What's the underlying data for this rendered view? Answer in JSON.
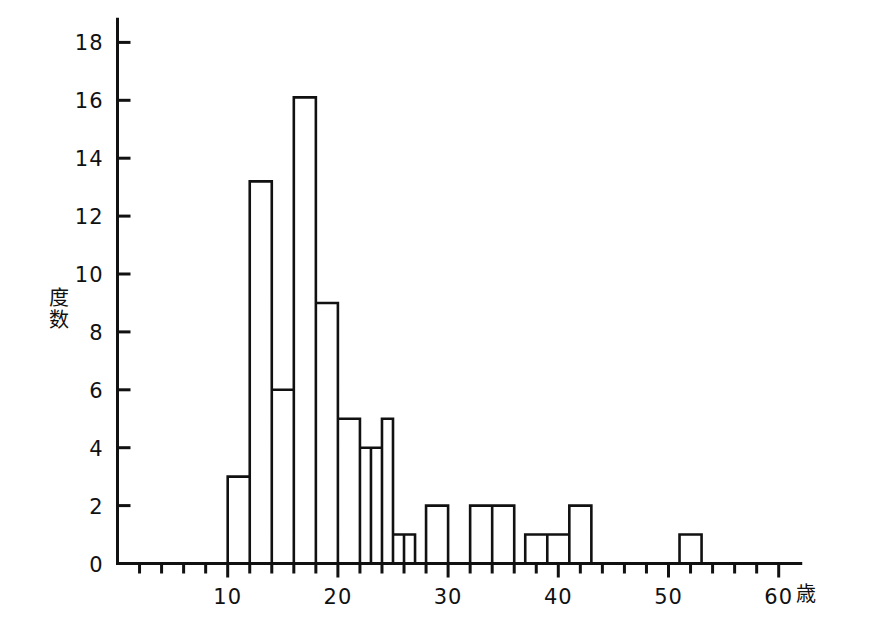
{
  "chart_data": {
    "type": "bar",
    "title": "",
    "subtitle": "",
    "xlabel": "歳",
    "ylabel": "度数",
    "xlim": [
      0,
      62
    ],
    "ylim": [
      0,
      18.8
    ],
    "bin_width": 2,
    "grid": false,
    "legend": false,
    "x_ticks": [
      0,
      2,
      4,
      6,
      8,
      10,
      12,
      14,
      16,
      18,
      20,
      22,
      24,
      26,
      28,
      30,
      32,
      34,
      36,
      38,
      40,
      42,
      44,
      46,
      48,
      50,
      52,
      54,
      56,
      58,
      60
    ],
    "x_tick_labels": [
      "10",
      "20",
      "30",
      "40",
      "50",
      "60"
    ],
    "x_labeled_ticks": [
      10,
      20,
      30,
      40,
      50,
      60
    ],
    "y_ticks": [
      0,
      2,
      4,
      6,
      8,
      10,
      12,
      14,
      16,
      18
    ],
    "y_tick_labels": [
      "0",
      "2",
      "4",
      "6",
      "8",
      "10",
      "12",
      "14",
      "16",
      "18"
    ],
    "bins": [
      {
        "start": 10,
        "end": 12,
        "value": 3
      },
      {
        "start": 12,
        "end": 14,
        "value": 13.2
      },
      {
        "start": 14,
        "end": 16,
        "value": 6
      },
      {
        "start": 16,
        "end": 18,
        "value": 16.1
      },
      {
        "start": 18,
        "end": 20,
        "value": 9
      },
      {
        "start": 20,
        "end": 22,
        "value": 5
      },
      {
        "start": 22,
        "end": 23,
        "value": 4
      },
      {
        "start": 23,
        "end": 24,
        "value": 4
      },
      {
        "start": 24,
        "end": 25,
        "value": 5
      },
      {
        "start": 25,
        "end": 26,
        "value": 1
      },
      {
        "start": 26,
        "end": 27,
        "value": 1
      },
      {
        "start": 28,
        "end": 30,
        "value": 2
      },
      {
        "start": 32,
        "end": 34,
        "value": 2
      },
      {
        "start": 34,
        "end": 36,
        "value": 2
      },
      {
        "start": 37,
        "end": 39,
        "value": 1
      },
      {
        "start": 39,
        "end": 41,
        "value": 1
      },
      {
        "start": 41,
        "end": 43,
        "value": 2
      },
      {
        "start": 51,
        "end": 53,
        "value": 1
      }
    ]
  }
}
